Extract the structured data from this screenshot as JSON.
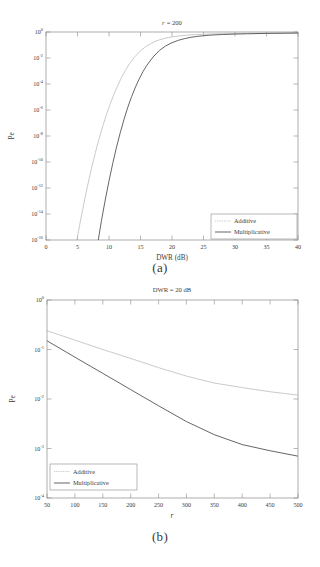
{
  "figure": {
    "caption_a": "(a)",
    "caption_b": "(b)"
  },
  "chart_data": [
    {
      "id": "a",
      "type": "line",
      "title": "r = 200",
      "title_variable": "r",
      "title_value": "= 200",
      "xlabel": "DWR (dB)",
      "ylabel": "Pe",
      "xlim": [
        0,
        40
      ],
      "ylim": [
        1e-16,
        1
      ],
      "yscale": "log",
      "xscale": "linear",
      "grid": false,
      "legend_position": "lower right",
      "xticks": [
        0,
        5,
        10,
        15,
        20,
        25,
        30,
        35,
        40
      ],
      "xtick_labels": [
        "0",
        "5",
        "10",
        "15",
        "20",
        "25",
        "30",
        "35",
        "40"
      ],
      "yticks": [
        1,
        0.01,
        0.0001,
        1e-06,
        1e-08,
        1e-10,
        1e-12,
        1e-14,
        1e-16
      ],
      "ytick_labels": [
        "10^0",
        "10^-2",
        "10^-4",
        "10^-6",
        "10^-8",
        "10^-10",
        "10^-12",
        "10^-14",
        "10^-16"
      ],
      "ytick_mantissa": "10",
      "ytick_exponents": [
        "0",
        "-2",
        "-4",
        "-6",
        "-8",
        "-10",
        "-12",
        "-14",
        "-16"
      ],
      "series": [
        {
          "name": "Additive",
          "style": "dotted",
          "color": "#b9b9b9",
          "x": [
            4.9,
            5.4,
            6.0,
            6.6,
            7.2,
            7.8,
            8.4,
            9.0,
            9.6,
            10.2,
            10.8,
            11.4,
            12.0,
            12.6,
            13.2,
            14.0,
            15.0,
            16.0,
            17.0,
            18.0,
            19.0,
            20.0,
            21.0,
            22.0,
            23.0,
            24.0,
            25.0,
            26.0,
            28.0,
            30.0,
            32.0,
            35.0,
            38.0,
            40.0
          ],
          "y": [
            1e-16,
            2e-15,
            6e-14,
            1.5e-12,
            3e-11,
            4.5e-10,
            5.5e-09,
            5.5e-08,
            4.5e-07,
            3e-06,
            1.7e-05,
            8e-05,
            0.00032,
            0.0011,
            0.0033,
            0.011,
            0.036,
            0.085,
            0.16,
            0.25,
            0.34,
            0.42,
            0.49,
            0.55,
            0.6,
            0.64,
            0.67,
            0.7,
            0.74,
            0.77,
            0.79,
            0.82,
            0.84,
            0.85
          ]
        },
        {
          "name": "Multiplicative",
          "style": "solid",
          "color": "#4a4a4a",
          "x": [
            8.3,
            8.8,
            9.4,
            10.0,
            10.6,
            11.2,
            11.8,
            12.4,
            13.0,
            13.6,
            14.2,
            14.8,
            15.4,
            16.0,
            17.0,
            18.0,
            19.0,
            20.0,
            21.0,
            22.0,
            23.0,
            24.0,
            25.0,
            26.0,
            27.0,
            28.0,
            30.0,
            32.0,
            35.0,
            38.0,
            40.0
          ],
          "y": [
            1e-16,
            3e-15,
            1.2e-13,
            3.5e-12,
            8e-11,
            1.4e-09,
            1.9e-08,
            2e-07,
            1.7e-06,
            1.1e-05,
            5.8e-05,
            0.00025,
            0.0009,
            0.0027,
            0.012,
            0.038,
            0.085,
            0.15,
            0.23,
            0.31,
            0.39,
            0.46,
            0.52,
            0.57,
            0.61,
            0.64,
            0.69,
            0.73,
            0.78,
            0.81,
            0.83
          ]
        }
      ],
      "legend_entries": [
        "Additive",
        "Multiplicative"
      ]
    },
    {
      "id": "b",
      "type": "line",
      "title": "DWR = 20 dB",
      "xlabel": "r",
      "ylabel": "Pe",
      "xlim": [
        50,
        500
      ],
      "ylim": [
        0.0001,
        1
      ],
      "yscale": "log",
      "xscale": "linear",
      "grid": false,
      "legend_position": "lower left",
      "xticks": [
        50,
        100,
        150,
        200,
        250,
        300,
        350,
        400,
        450,
        500
      ],
      "xtick_labels": [
        "50",
        "100",
        "150",
        "200",
        "250",
        "300",
        "350",
        "400",
        "450",
        "500"
      ],
      "yticks": [
        1,
        0.1,
        0.01,
        0.001,
        0.0001
      ],
      "ytick_labels": [
        "10^0",
        "10^-1",
        "10^-2",
        "10^-3",
        "10^-4"
      ],
      "ytick_mantissa": "10",
      "ytick_exponents": [
        "0",
        "-1",
        "-2",
        "-3",
        "-4"
      ],
      "series": [
        {
          "name": "Additive",
          "style": "dotted",
          "color": "#b9b9b9",
          "x": [
            50,
            100,
            150,
            200,
            250,
            300,
            350,
            400,
            450,
            500
          ],
          "y": [
            0.24,
            0.155,
            0.1,
            0.066,
            0.043,
            0.029,
            0.021,
            0.017,
            0.014,
            0.012
          ]
        },
        {
          "name": "Multiplicative",
          "style": "solid",
          "color": "#4a4a4a",
          "x": [
            50,
            100,
            150,
            200,
            250,
            300,
            350,
            400,
            450,
            500
          ],
          "y": [
            0.15,
            0.07,
            0.033,
            0.0155,
            0.0073,
            0.0035,
            0.0019,
            0.0012,
            0.0009,
            0.0007
          ]
        }
      ],
      "legend_entries": [
        "Additive",
        "Multiplicative"
      ]
    }
  ]
}
